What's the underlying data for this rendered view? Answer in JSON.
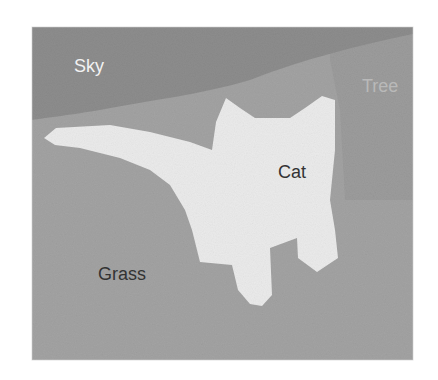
{
  "figure": {
    "type": "semantic-segmentation-map",
    "colors": {
      "sky": "#8c8c8c",
      "grass": "#a3a3a3",
      "tree": "#9a9a9a",
      "cat": "#ebebeb",
      "background": "#ffffff"
    },
    "regions": [
      {
        "id": "sky",
        "label": "Sky"
      },
      {
        "id": "tree",
        "label": "Tree"
      },
      {
        "id": "cat",
        "label": "Cat"
      },
      {
        "id": "grass",
        "label": "Grass"
      }
    ]
  }
}
